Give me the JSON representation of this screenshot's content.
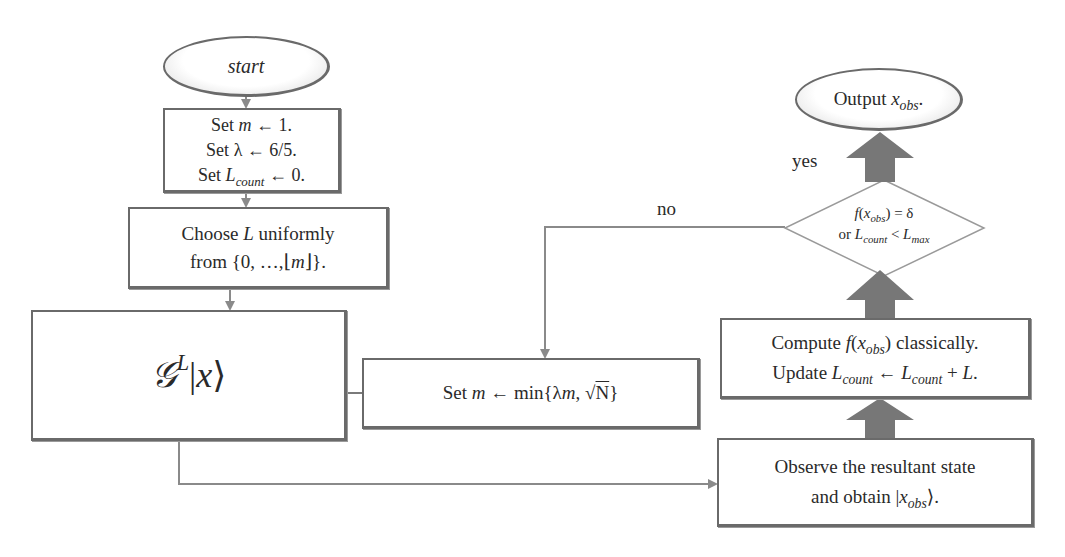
{
  "colors": {
    "line": "#8a8a8a",
    "border": "#6a6a6a",
    "thick_arrow": "#7a7a7a",
    "background": "#ffffff"
  },
  "nodes": {
    "start": {
      "shape": "ellipse",
      "text": "start"
    },
    "init": {
      "shape": "rect",
      "lines": [
        {
          "prefix": "Set ",
          "var": "m",
          "sub": "",
          "suffix": " ← 1."
        },
        {
          "prefix": "Set ",
          "var": "λ",
          "sub": "",
          "suffix": " ← 6/5."
        },
        {
          "prefix": "Set ",
          "var": "L",
          "sub": "count",
          "suffix": " ← 0."
        }
      ]
    },
    "choose": {
      "shape": "rect",
      "line1_prefix": "Choose ",
      "line1_var": "L",
      "line1_suffix": " uniformly",
      "line2_prefix": "from {0, …,⌊",
      "line2_var": "m",
      "line2_suffix": "⌋}."
    },
    "grover": {
      "shape": "rect",
      "operator": "𝒢",
      "power": "L",
      "ket_open": "|",
      "ket_var": "x",
      "ket_close": "⟩"
    },
    "update_m": {
      "shape": "rect",
      "prefix": "Set ",
      "var": "m",
      "middle": " ← min{λ",
      "var2": "m",
      "comma": ", √",
      "radicand": "N",
      "close": "}"
    },
    "observe": {
      "shape": "rect",
      "line1": "Observe the resultant state",
      "line2_prefix": "and obtain |",
      "line2_var": "x",
      "line2_sub": "obs",
      "line2_suffix": "⟩."
    },
    "compute": {
      "shape": "rect",
      "line1_prefix": "Compute ",
      "line1_func": "f",
      "line1_open": "(",
      "line1_var": "x",
      "line1_sub": "obs",
      "line1_suffix": ") classically.",
      "line2_prefix": "Update ",
      "line2_var1": "L",
      "line2_sub1": "count",
      "line2_arrow": " ← ",
      "line2_var2": "L",
      "line2_sub2": "count",
      "line2_plus": " + ",
      "line2_var3": "L",
      "line2_end": "."
    },
    "decision": {
      "shape": "diamond",
      "line1_func": "f",
      "line1_open": "(",
      "line1_var": "x",
      "line1_sub": "obs",
      "line1_suffix": ") = δ",
      "line2_prefix": "or ",
      "line2_var1": "L",
      "line2_sub1": "count",
      "line2_mid": " < ",
      "line2_var2": "L",
      "line2_sub2": "max"
    },
    "output": {
      "shape": "ellipse",
      "prefix": "Output ",
      "var": "x",
      "sub": "obs",
      "suffix": "."
    }
  },
  "edges": [
    {
      "from": "start",
      "to": "init"
    },
    {
      "from": "init",
      "to": "choose"
    },
    {
      "from": "choose",
      "to": "grover"
    },
    {
      "from": "grover",
      "to": "observe"
    },
    {
      "from": "observe",
      "to": "compute",
      "style": "thick"
    },
    {
      "from": "compute",
      "to": "decision",
      "style": "thick"
    },
    {
      "from": "decision",
      "to": "output",
      "style": "thick",
      "label": "yes"
    },
    {
      "from": "decision",
      "to": "update_m",
      "label": "no"
    },
    {
      "from": "update_m",
      "to": "grover"
    }
  ],
  "edge_labels": {
    "yes": "yes",
    "no": "no"
  }
}
